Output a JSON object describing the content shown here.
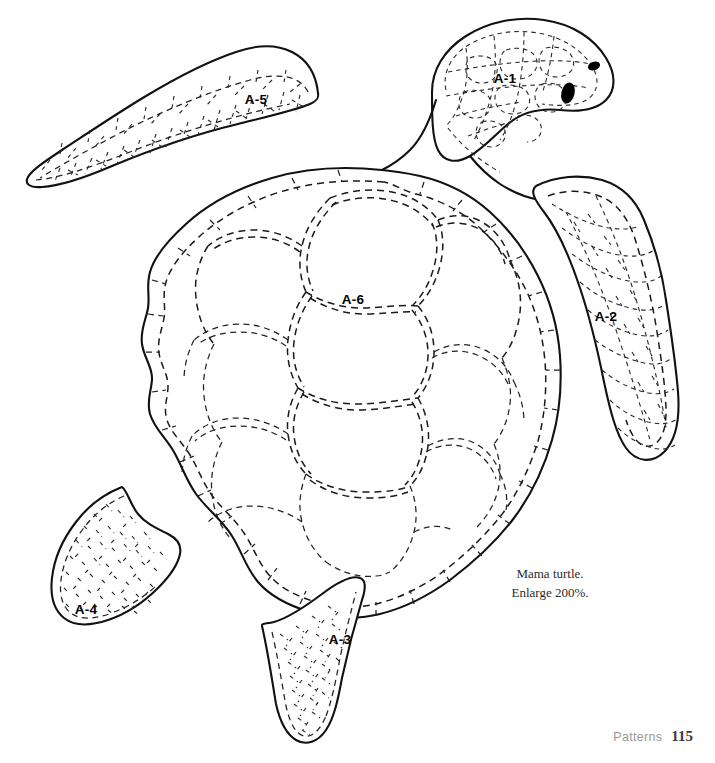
{
  "page": {
    "kind": "sewing-pattern-page",
    "background_color": "#ffffff",
    "ink_color": "#111111",
    "width": 715,
    "height": 763
  },
  "subject": {
    "name": "sea-turtle-pattern",
    "view": "top-down",
    "piece_count": 6
  },
  "caption": {
    "line1": "Mama turtle.",
    "line2": "Enlarge 200%."
  },
  "footer": {
    "section": "Patterns",
    "page_number": "115"
  },
  "labels": [
    {
      "id": "A-1",
      "text": "A-1",
      "part": "head",
      "x": 505,
      "y": 78
    },
    {
      "id": "A-2",
      "text": "A-2",
      "part": "right-front-flipper",
      "x": 606,
      "y": 316
    },
    {
      "id": "A-3",
      "text": "A-3",
      "part": "rear-bottom-flipper",
      "x": 340,
      "y": 639
    },
    {
      "id": "A-4",
      "text": "A-4",
      "part": "left-rear-flipper",
      "x": 86,
      "y": 609
    },
    {
      "id": "A-5",
      "text": "A-5",
      "part": "left-front-flipper",
      "x": 256,
      "y": 104
    },
    {
      "id": "A-6",
      "text": "A-6",
      "part": "shell-center-scute",
      "x": 353,
      "y": 299
    }
  ],
  "line_styles": {
    "solid_outline": {
      "color": "#111111",
      "width": 2.1
    },
    "dashed_seam": {
      "color": "#1a1a1a",
      "width": 1.5,
      "dash": "7 5"
    },
    "fine_texture": {
      "color": "#2a2a2a",
      "width": 1.15,
      "dash": "4 4.5"
    }
  },
  "eye": {
    "color": "#000000",
    "count": 2,
    "parts": [
      "eye",
      "nostril"
    ]
  }
}
